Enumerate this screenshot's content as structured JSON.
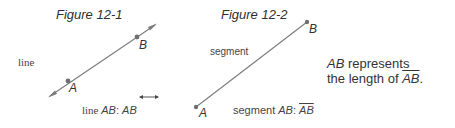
{
  "figure1": {
    "title": "Figure 12-1",
    "side_label": "line",
    "point_a": "A",
    "point_b": "B",
    "caption_prefix": "line ",
    "caption_name": "AB",
    "caption_sep": ": ",
    "caption_notation": "AB"
  },
  "figure2": {
    "title": "Figure 12-2",
    "side_label": "segment",
    "point_a": "A",
    "point_b": "B",
    "caption_prefix": "segment ",
    "caption_name": "AB",
    "caption_sep": ": ",
    "caption_notation": "AB"
  },
  "note": {
    "line1_name": "AB",
    "line1_rest": " represents",
    "line2_prefix": "the length of ",
    "line2_notation": "AB",
    "line2_end": "."
  },
  "colors": {
    "line": "#7a7a7a",
    "point": "#6f6f6f",
    "text": "#333333"
  }
}
